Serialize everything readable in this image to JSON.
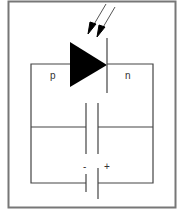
{
  "diagram": {
    "labels": {
      "p_region": "p",
      "n_region": "n",
      "minus": "-",
      "plus": "+"
    },
    "components": [
      "light-arrows",
      "photodiode",
      "capacitor",
      "battery"
    ],
    "colors": {
      "line": "#444444",
      "frame": "#777777",
      "fill": "#000000",
      "background": "#ffffff"
    }
  }
}
